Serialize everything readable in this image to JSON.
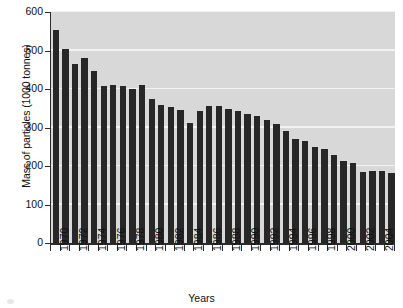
{
  "chart_data": {
    "type": "bar",
    "title": "",
    "xlabel": "Years",
    "ylabel": "Mass of particles (1000 tonnes)",
    "ylim": [
      0,
      600
    ],
    "yticks": [
      0,
      100,
      200,
      300,
      400,
      500,
      600
    ],
    "grid": true,
    "grid_color": "#f2f2f2",
    "plot_background": "#d8d8d8",
    "bar_color": "#272727",
    "axis_color": "#2b2b2b",
    "legend": null,
    "x_tick_label_interval": 2,
    "categories": [
      "1970",
      "1971",
      "1972",
      "1973",
      "1974",
      "1975",
      "1976",
      "1977",
      "1978",
      "1979",
      "1980",
      "1981",
      "1982",
      "1983",
      "1984",
      "1985",
      "1986",
      "1987",
      "1988",
      "1989",
      "1990",
      "1991",
      "1992",
      "1993",
      "1994",
      "1995",
      "1996",
      "1997",
      "1998",
      "1999",
      "2000",
      "2001",
      "2002",
      "2003",
      "2004",
      "2005"
    ],
    "visible_tick_labels": [
      "1970",
      "1972",
      "1974",
      "1976",
      "1978",
      "1980",
      "1982",
      "1984",
      "1986",
      "1988",
      "1990",
      "1992",
      "1994",
      "1996",
      "1998",
      "2000",
      "2002",
      "2004"
    ],
    "values": [
      553,
      505,
      465,
      480,
      448,
      409,
      410,
      409,
      400,
      410,
      374,
      359,
      353,
      345,
      311,
      344,
      357,
      357,
      347,
      343,
      335,
      331,
      320,
      308,
      292,
      269,
      266,
      250,
      245,
      228,
      214,
      209,
      185,
      186,
      186,
      183
    ]
  }
}
